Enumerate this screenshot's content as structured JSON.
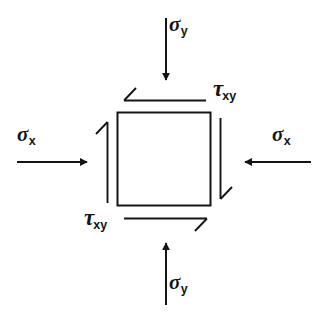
{
  "figure": {
    "background_color": "#ffffff",
    "stroke_color": "#141414",
    "element": {
      "name": "stress-element-square",
      "x": 117,
      "y": 112,
      "width": 93,
      "height": 93
    },
    "labels": {
      "sigma_y_top": {
        "base": "σ",
        "sub": "y"
      },
      "sigma_y_bottom": {
        "base": "σ",
        "sub": "y"
      },
      "sigma_x_left": {
        "base": "σ",
        "sub": "x"
      },
      "sigma_x_right": {
        "base": "σ",
        "sub": "x"
      },
      "tau_xy_top": {
        "base": "τ",
        "sub": "xy"
      },
      "tau_xy_bottom": {
        "base": "τ",
        "sub": "xy"
      }
    },
    "arrows": [
      {
        "name": "sigma-y-top-arrow",
        "type": "normal-stress",
        "direction": "down",
        "head": "solid"
      },
      {
        "name": "sigma-y-bottom-arrow",
        "type": "normal-stress",
        "direction": "up",
        "head": "solid"
      },
      {
        "name": "sigma-x-left-arrow",
        "type": "normal-stress",
        "direction": "right",
        "head": "solid"
      },
      {
        "name": "sigma-x-right-arrow",
        "type": "normal-stress",
        "direction": "left",
        "head": "solid"
      },
      {
        "name": "tau-top-arrow",
        "type": "shear-stress",
        "direction": "left",
        "head": "open"
      },
      {
        "name": "tau-bottom-arrow",
        "type": "shear-stress",
        "direction": "right",
        "head": "open"
      },
      {
        "name": "tau-left-arrow",
        "type": "shear-stress",
        "direction": "up",
        "head": "open"
      },
      {
        "name": "tau-right-arrow",
        "type": "shear-stress",
        "direction": "down",
        "head": "open"
      }
    ]
  }
}
